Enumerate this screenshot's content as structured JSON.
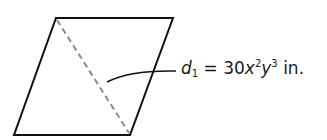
{
  "diagram": {
    "shape": "parallelogram",
    "vertices": {
      "top_left": [
        56,
        18
      ],
      "top_right": [
        173,
        18
      ],
      "bottom_right": [
        130,
        135
      ],
      "bottom_left": [
        14,
        135
      ]
    },
    "diagonal_style": "dashed",
    "diagonal_color": "#8a8a8a",
    "label": {
      "var": "d",
      "sub": "1",
      "eq": " = 30",
      "x": "x",
      "x_exp": "2",
      "y": "y",
      "y_exp": "3",
      "unit": " in."
    }
  }
}
